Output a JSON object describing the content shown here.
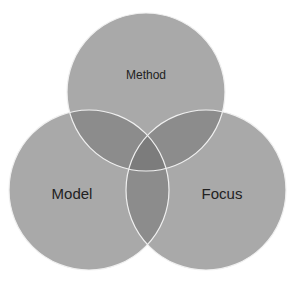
{
  "diagram": {
    "type": "venn",
    "sets": [
      {
        "id": "method",
        "label": "Method",
        "cx": 146,
        "cy": 92,
        "r": 79,
        "label_x": 146,
        "label_y": 79,
        "font_size": 12
      },
      {
        "id": "model",
        "label": "Model",
        "cx": 89,
        "cy": 190,
        "r": 80,
        "label_x": 72,
        "label_y": 199,
        "font_size": 15
      },
      {
        "id": "focus",
        "label": "Focus",
        "cx": 206,
        "cy": 190,
        "r": 80,
        "label_x": 222,
        "label_y": 199,
        "font_size": 15
      }
    ],
    "colors": {
      "fill": "#a9a9a9",
      "fill_opacity": 0.85,
      "overlap_tint": "#6a6a6a",
      "stroke": "#f2f2f2",
      "background": "#ffffff"
    }
  }
}
